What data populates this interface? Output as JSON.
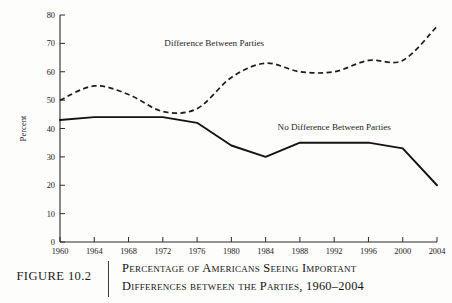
{
  "figure": {
    "number_label": "FIGURE 10.2",
    "caption_line_1": "Percentage of Americans Seeing Important",
    "caption_line_2": "Differences between the Parties, 1960–2004"
  },
  "chart_data": {
    "type": "line",
    "title": "",
    "xlabel": "",
    "ylabel": "Percent",
    "xlim": [
      1960,
      2004
    ],
    "ylim": [
      0,
      80
    ],
    "grid": false,
    "legend_position": "inline-annotations",
    "x": [
      1960,
      1964,
      1968,
      1972,
      1976,
      1980,
      1984,
      1988,
      1992,
      1996,
      2000,
      2004
    ],
    "xticklabels": [
      "1960",
      "1964",
      "1968",
      "1972",
      "1976",
      "1980",
      "1984",
      "1988",
      "1992",
      "1996",
      "2000",
      "2004"
    ],
    "yticks": [
      0,
      10,
      20,
      30,
      40,
      50,
      60,
      70,
      80
    ],
    "yticklabels": [
      "0",
      "10",
      "20",
      "30",
      "40",
      "50",
      "60",
      "70",
      "80"
    ],
    "series": [
      {
        "name": "Difference Between Parties",
        "style": "dashed",
        "color": "#1d1d1d",
        "values": [
          50,
          55,
          52,
          46,
          47,
          58,
          63,
          60,
          60,
          64,
          64,
          76
        ]
      },
      {
        "name": "No Difference Between Parties",
        "style": "solid",
        "color": "#131313",
        "values": [
          43,
          44,
          44,
          44,
          42,
          34,
          30,
          35,
          35,
          35,
          33,
          20
        ]
      }
    ],
    "annotations": [
      {
        "text": "Difference Between Parties",
        "x": 1978,
        "y": 69
      },
      {
        "text": "No Difference Between Parties",
        "x": 1992,
        "y": 39.5
      }
    ]
  }
}
